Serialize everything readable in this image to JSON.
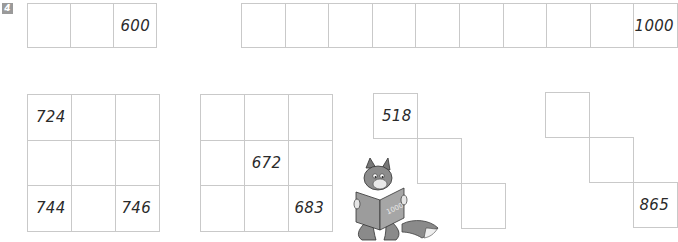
{
  "exercise": {
    "number": "4"
  },
  "top_rows": {
    "short_row": {
      "cells": [
        "",
        "",
        "600"
      ]
    },
    "long_row": {
      "cells": [
        "",
        "",
        "",
        "",
        "",
        "",
        "",
        "",
        "",
        "1000"
      ]
    }
  },
  "grids": {
    "grid_a": {
      "cells": [
        [
          "724",
          "",
          ""
        ],
        [
          "",
          "",
          ""
        ],
        [
          "744",
          "",
          "746"
        ]
      ]
    },
    "grid_b": {
      "cells": [
        [
          "",
          "",
          ""
        ],
        [
          "",
          "672",
          ""
        ],
        [
          "",
          "",
          "683"
        ]
      ]
    }
  },
  "staircases": {
    "stair_c": {
      "cells": [
        "518",
        "",
        ""
      ]
    },
    "stair_d": {
      "cells": [
        "",
        "",
        "865"
      ]
    }
  },
  "illustration": {
    "description": "fox reading a book",
    "book_label": "1000"
  }
}
